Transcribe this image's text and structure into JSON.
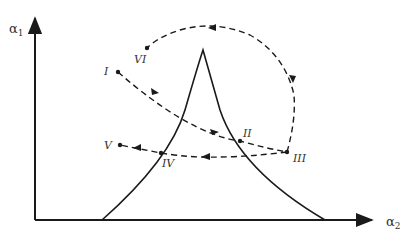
{
  "axes": {
    "y_label": "α",
    "y_subscript": "1",
    "x_label": "α",
    "x_subscript": "2"
  },
  "points": [
    {
      "id": "I",
      "label": "I"
    },
    {
      "id": "II",
      "label": "II"
    },
    {
      "id": "III",
      "label": "III"
    },
    {
      "id": "IV",
      "label": "IV"
    },
    {
      "id": "V",
      "label": "V"
    },
    {
      "id": "VI",
      "label": "VI"
    }
  ],
  "colors": {
    "line": "#1a1a1a",
    "background": "#ffffff"
  }
}
